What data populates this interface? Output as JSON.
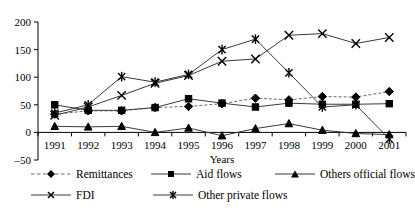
{
  "chart_data": {
    "type": "line",
    "title": "",
    "xlabel": "Years",
    "ylabel": "",
    "categories": [
      "1991",
      "1992",
      "1993",
      "1994",
      "1995",
      "1996",
      "1997",
      "1998",
      "1999",
      "2000",
      "2001"
    ],
    "x": [
      1991,
      1992,
      1993,
      1994,
      1995,
      1996,
      1997,
      1998,
      1999,
      2000,
      2001
    ],
    "ylim": [
      -50,
      200
    ],
    "yticks": [
      -50,
      0,
      50,
      100,
      150,
      200
    ],
    "ytick_labels": [
      "–50",
      "0",
      "50",
      "100",
      "150",
      "200"
    ],
    "grid": false,
    "legend_position": "below",
    "series": [
      {
        "name": "Remittances",
        "marker": "diamond",
        "line_style": "dashed",
        "color": "#000000",
        "values": [
          33,
          39,
          39,
          45,
          47,
          52,
          62,
          59,
          65,
          64,
          74
        ]
      },
      {
        "name": "Aid flows",
        "marker": "square",
        "line_style": "solid",
        "color": "#000000",
        "values": [
          50,
          40,
          40,
          45,
          61,
          53,
          46,
          53,
          51,
          51,
          52
        ]
      },
      {
        "name": "Others official flows",
        "marker": "triangle",
        "line_style": "solid",
        "color": "#000000",
        "values": [
          11,
          10,
          11,
          0,
          8,
          -6,
          7,
          16,
          4,
          -2,
          -4
        ]
      },
      {
        "name": "FDI",
        "marker": "x",
        "line_style": "solid",
        "color": "#000000",
        "values": [
          31,
          46,
          67,
          89,
          103,
          129,
          133,
          176,
          179,
          161,
          172
        ]
      },
      {
        "name": "Other private flows",
        "marker": "asterisk",
        "line_style": "solid",
        "color": "#000000",
        "values": [
          35,
          50,
          101,
          91,
          105,
          150,
          169,
          108,
          46,
          50,
          -12
        ]
      }
    ]
  },
  "axes": {
    "x_axis_title": "Years"
  },
  "legend": {
    "items": [
      {
        "label": "Remittances",
        "marker": "diamond",
        "style": "dashed"
      },
      {
        "label": "Aid flows",
        "marker": "square",
        "style": "solid"
      },
      {
        "label": "Others official flows",
        "marker": "triangle",
        "style": "solid"
      },
      {
        "label": "FDI",
        "marker": "x",
        "style": "solid"
      },
      {
        "label": "Other private flows",
        "marker": "asterisk",
        "style": "solid"
      }
    ]
  },
  "colors": {
    "background": "#ffffff",
    "foreground": "#000000",
    "line": "#3a3a3a",
    "dashed_line": "#6a6a6a"
  }
}
